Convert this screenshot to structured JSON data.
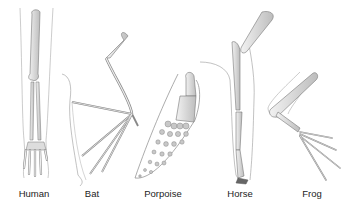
{
  "figure": {
    "labels": {
      "human": "Human",
      "bat": "Bat",
      "porpoise": "Porpoise",
      "horse": "Horse",
      "frog": "Frog"
    },
    "colors": {
      "bone_fill": "#e4e4e4",
      "bone_shade": "#b8b8b8",
      "outline": "#777777",
      "skin_line": "#999999",
      "label_text": "#222222"
    }
  }
}
